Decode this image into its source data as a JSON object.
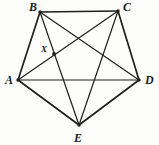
{
  "figure": {
    "name": "pentagon-with-all-diagonals",
    "width": 159,
    "height": 145,
    "background_color": "#fdfdfc",
    "stroke_color": "#1f1f1f",
    "label_color": "#1c1c1c"
  },
  "vertices": [
    {
      "id": "A",
      "label": "A",
      "x": 18,
      "y": 80,
      "label_x": 5,
      "label_y": 74
    },
    {
      "id": "B",
      "label": "B",
      "x": 40,
      "y": 12,
      "label_x": 29,
      "label_y": 1
    },
    {
      "id": "C",
      "label": "C",
      "x": 118,
      "y": 11,
      "label_x": 123,
      "label_y": 1
    },
    {
      "id": "D",
      "label": "D",
      "x": 139,
      "y": 80,
      "label_x": 145,
      "label_y": 74
    },
    {
      "id": "E",
      "label": "E",
      "x": 79,
      "y": 125,
      "label_x": 74,
      "label_y": 132
    }
  ],
  "marked_points": [
    {
      "id": "X",
      "label": "X",
      "x": 54,
      "y": 54,
      "label_x": 41,
      "label_y": 45,
      "radius": 1.9
    }
  ],
  "edges": [
    {
      "from": "A",
      "to": "B",
      "kind": "side"
    },
    {
      "from": "B",
      "to": "C",
      "kind": "side"
    },
    {
      "from": "C",
      "to": "D",
      "kind": "side"
    },
    {
      "from": "D",
      "to": "E",
      "kind": "side"
    },
    {
      "from": "E",
      "to": "A",
      "kind": "side"
    },
    {
      "from": "A",
      "to": "C",
      "kind": "diagonal"
    },
    {
      "from": "A",
      "to": "D",
      "kind": "diagonal"
    },
    {
      "from": "B",
      "to": "D",
      "kind": "diagonal"
    },
    {
      "from": "B",
      "to": "E",
      "kind": "diagonal"
    },
    {
      "from": "C",
      "to": "E",
      "kind": "diagonal"
    }
  ],
  "stroke_widths": {
    "side": 1.7,
    "diagonal": 1.2
  }
}
